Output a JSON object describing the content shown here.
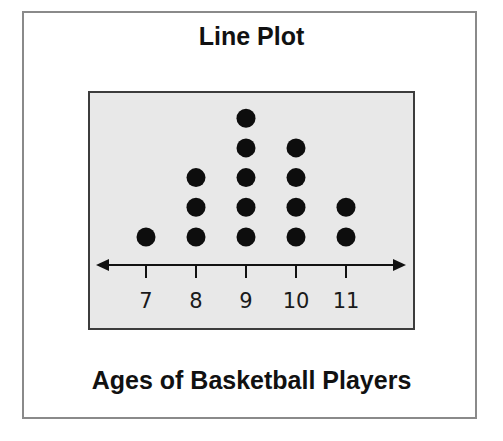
{
  "title": "Line Plot",
  "subtitle": "Ages of Basketball Players",
  "colors": {
    "frame_border": "#8a8a8a",
    "plot_background": "#e8e8e8",
    "plot_border": "#3c3c3c",
    "dot": "#0d0d0d",
    "axis": "#111111"
  },
  "axis": {
    "ticks": [
      "7",
      "8",
      "9",
      "10",
      "11"
    ]
  },
  "chart_data": {
    "type": "scatter",
    "subtype": "dot_plot",
    "title": "Line Plot",
    "xlabel": "Ages of Basketball Players",
    "ylabel": "",
    "categories": [
      7,
      8,
      9,
      10,
      11
    ],
    "values": [
      1,
      3,
      5,
      4,
      2
    ],
    "x": [
      7,
      8,
      8,
      8,
      9,
      9,
      9,
      9,
      9,
      10,
      10,
      10,
      10,
      11,
      11
    ],
    "tick_labels": [
      "7",
      "8",
      "9",
      "10",
      "11"
    ],
    "xlim": [
      6.2,
      12.2
    ],
    "grid": false,
    "legend": null,
    "axis_arrows": true
  }
}
